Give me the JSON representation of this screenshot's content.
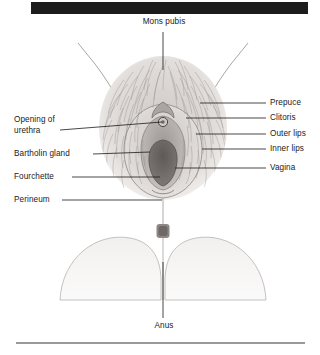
{
  "figure": {
    "title_bar": {
      "name": "header-black-bar",
      "color": "#1c1c1c"
    },
    "footer_rule": {
      "name": "footer-rule",
      "color": "#9a9a9a"
    },
    "background_color": "#ffffff",
    "ink_color": "#1a1a1a",
    "illustration_tone": "#b9b5b2",
    "vagina_tone": "#6f6a68"
  },
  "labels": {
    "mons_pubis": "Mons pubis",
    "opening_of_urethra_line1": "Opening of",
    "opening_of_urethra_line2": "urethra",
    "bartholin_gland": "Bartholin gland",
    "fourchette": "Fourchette",
    "perineum": "Perineum",
    "prepuce": "Prepuce",
    "clitoris": "Clitoris",
    "outer_lips": "Outer lips",
    "inner_lips": "Inner lips",
    "vagina": "Vagina",
    "anus": "Anus"
  }
}
